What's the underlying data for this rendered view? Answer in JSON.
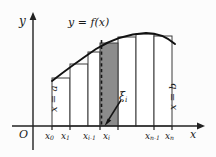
{
  "figure": {
    "axes": {
      "origin_label": "O",
      "y_axis_label": "y",
      "x_axis_label": "x"
    },
    "curve_label": "y = f(x)",
    "left_boundary_label": "x = a",
    "right_boundary_label": "x = b",
    "sample_point_label": "ξ",
    "sample_point_sub": "i",
    "tick_labels": [
      {
        "base": "x",
        "sub": "0",
        "x": 55
      },
      {
        "base": "x",
        "sub": "1",
        "x": 71
      },
      {
        "base": "x",
        "sub": "i‑1",
        "x": 93
      },
      {
        "base": "x",
        "sub": "i",
        "x": 113
      },
      {
        "base": "x",
        "sub": "n‑1",
        "x": 155
      },
      {
        "base": "x",
        "sub": "n",
        "x": 175
      }
    ],
    "colors": {
      "ink": "#1a1a1a",
      "curve": "#111111",
      "rect_stroke": "#3a3a3a",
      "shaded_fill": "#8c8c8c",
      "axis": "#222222",
      "background": "#fcfcfc"
    }
  },
  "chart_data": {
    "type": "area",
    "title": "y = f(x)",
    "xlabel": "x",
    "ylabel": "y",
    "grid": false,
    "legend": "none",
    "xlim": [
      0,
      216
    ],
    "ylim": [
      0,
      157
    ],
    "x_axis_y": 126,
    "y_axis_x": 33,
    "partition_x": [
      52,
      70,
      88,
      100,
      118,
      136,
      154,
      172
    ],
    "rect_tops_y": [
      78,
      64,
      52,
      43,
      37,
      34,
      36,
      42
    ],
    "shaded_rect_index": 3,
    "shaded_rect": {
      "x0": 100,
      "x1": 118,
      "top": 43
    },
    "dashed_line_x": 101,
    "dashed_line_top": 40,
    "curve_points": [
      [
        52,
        81
      ],
      [
        60,
        73
      ],
      [
        70,
        66
      ],
      [
        80,
        58
      ],
      [
        90,
        52
      ],
      [
        100,
        46
      ],
      [
        110,
        41
      ],
      [
        120,
        38
      ],
      [
        130,
        35
      ],
      [
        140,
        33
      ],
      [
        150,
        33
      ],
      [
        160,
        35
      ],
      [
        170,
        40
      ],
      [
        174,
        43
      ]
    ],
    "sample_point_x": 108,
    "annotation_arrow": {
      "from_x": 122,
      "from_y": 101,
      "to_x": 106,
      "to_y": 123
    }
  }
}
